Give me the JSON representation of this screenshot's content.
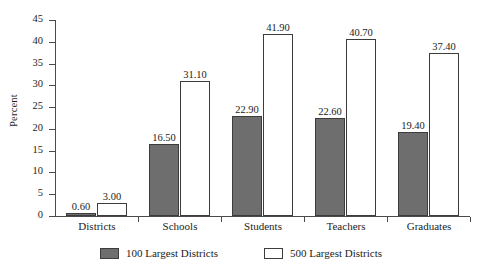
{
  "chart_data": {
    "type": "bar",
    "title": "",
    "subtitle": "",
    "xlabel": "",
    "ylabel": "Percent",
    "ylim": [
      0,
      45
    ],
    "ytick_step": 5,
    "yticks": [
      "0",
      "5",
      "10",
      "15",
      "20",
      "25",
      "30",
      "35",
      "40",
      "45"
    ],
    "grid": false,
    "legend_position": "bottom-center",
    "categories": [
      "Districts",
      "Schools",
      "Students",
      "Teachers",
      "Graduates"
    ],
    "series": [
      {
        "name": "100 Largest Districts",
        "color": "#6e6e6e",
        "border_color": "#3c3c3c",
        "values": [
          0.6,
          16.5,
          22.9,
          22.6,
          19.4
        ],
        "labels": [
          "0.60",
          "16.50",
          "22.90",
          "22.60",
          "19.40"
        ]
      },
      {
        "name": "500 Largest Districts",
        "color": "#ffffff",
        "border_color": "#3c3c3c",
        "values": [
          3.0,
          31.1,
          41.9,
          40.7,
          37.4
        ],
        "labels": [
          "3.00",
          "31.10",
          "41.90",
          "40.70",
          "37.40"
        ]
      }
    ]
  },
  "legend": {
    "items": [
      {
        "label": "100 Largest Districts",
        "swatch": "filled-gray-swatch"
      },
      {
        "label": "500 Largest Districts",
        "swatch": "empty-white-swatch"
      }
    ]
  },
  "axes": {
    "y_title": "Percent"
  }
}
